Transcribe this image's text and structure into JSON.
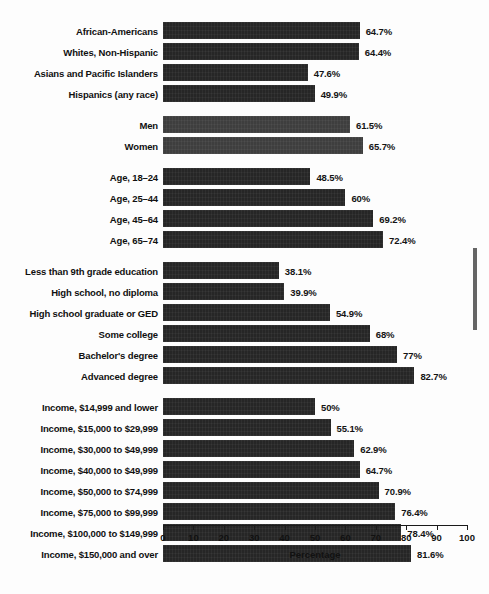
{
  "chart_data": {
    "type": "bar",
    "orientation": "horizontal",
    "title": "",
    "xlabel": "Percentage",
    "ylabel": "",
    "xlim": [
      0,
      100
    ],
    "xticks": [
      0,
      10,
      20,
      30,
      40,
      50,
      60,
      70,
      80,
      90,
      100
    ],
    "xtick_labels": [
      "0",
      "10",
      "20",
      "30",
      "40",
      "50",
      "60",
      "70",
      "80",
      "90",
      "100"
    ],
    "grid": false,
    "legend": "none",
    "bar_color": "#262626",
    "bar_color_alt": "#3e3e3e",
    "groups": [
      {
        "name": "race-ethnicity",
        "shade": "dark",
        "bars": [
          {
            "label": "African-Americans",
            "value": 64.7,
            "value_label": "64.7%"
          },
          {
            "label": "Whites, Non-Hispanic",
            "value": 64.4,
            "value_label": "64.4%"
          },
          {
            "label": "Asians and Pacific Islanders",
            "value": 47.6,
            "value_label": "47.6%"
          },
          {
            "label": "Hispanics (any race)",
            "value": 49.9,
            "value_label": "49.9%"
          }
        ]
      },
      {
        "name": "gender",
        "shade": "light",
        "bars": [
          {
            "label": "Men",
            "value": 61.5,
            "value_label": "61.5%"
          },
          {
            "label": "Women",
            "value": 65.7,
            "value_label": "65.7%"
          }
        ]
      },
      {
        "name": "age",
        "shade": "dark",
        "bars": [
          {
            "label": "Age, 18–24",
            "value": 48.5,
            "value_label": "48.5%"
          },
          {
            "label": "Age, 25–44",
            "value": 60,
            "value_label": "60%"
          },
          {
            "label": "Age, 45–64",
            "value": 69.2,
            "value_label": "69.2%"
          },
          {
            "label": "Age, 65–74",
            "value": 72.4,
            "value_label": "72.4%"
          }
        ]
      },
      {
        "name": "education",
        "shade": "dark",
        "bars": [
          {
            "label": "Less than 9th grade education",
            "value": 38.1,
            "value_label": "38.1%"
          },
          {
            "label": "High school, no diploma",
            "value": 39.9,
            "value_label": "39.9%"
          },
          {
            "label": "High school graduate or GED",
            "value": 54.9,
            "value_label": "54.9%"
          },
          {
            "label": "Some college",
            "value": 68,
            "value_label": "68%"
          },
          {
            "label": "Bachelor's degree",
            "value": 77,
            "value_label": "77%"
          },
          {
            "label": "Advanced degree",
            "value": 82.7,
            "value_label": "82.7%"
          }
        ]
      },
      {
        "name": "income",
        "shade": "dark",
        "bars": [
          {
            "label": "Income, $14,999 and lower",
            "value": 50,
            "value_label": "50%"
          },
          {
            "label": "Income, $15,000 to $29,999",
            "value": 55.1,
            "value_label": "55.1%"
          },
          {
            "label": "Income, $30,000 to $49,999",
            "value": 62.9,
            "value_label": "62.9%"
          },
          {
            "label": "Income, $40,000 to $49,999",
            "value": 64.7,
            "value_label": "64.7%"
          },
          {
            "label": "Income, $50,000 to $74,999",
            "value": 70.9,
            "value_label": "70.9%"
          },
          {
            "label": "Income, $75,000 to $99,999",
            "value": 76.4,
            "value_label": "76.4%"
          },
          {
            "label": "Income, $100,000 to $149,999",
            "value": 78.4,
            "value_label": "78.4%"
          },
          {
            "label": "Income, $150,000 and over",
            "value": 81.6,
            "value_label": "81.6%"
          }
        ]
      }
    ]
  }
}
